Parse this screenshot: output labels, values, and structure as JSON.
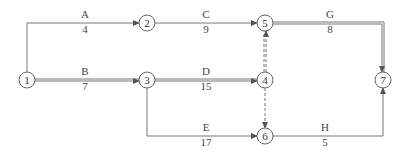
{
  "diagram": {
    "type": "activity-on-arrow network",
    "nodes": [
      {
        "id": "1",
        "label": "1"
      },
      {
        "id": "2",
        "label": "2"
      },
      {
        "id": "3",
        "label": "3"
      },
      {
        "id": "4",
        "label": "4"
      },
      {
        "id": "5",
        "label": "5"
      },
      {
        "id": "6",
        "label": "6"
      },
      {
        "id": "7",
        "label": "7"
      }
    ],
    "activities": [
      {
        "name": "A",
        "duration": "4",
        "from": "1",
        "to": "2",
        "critical": false
      },
      {
        "name": "B",
        "duration": "7",
        "from": "1",
        "to": "3",
        "critical": true
      },
      {
        "name": "C",
        "duration": "9",
        "from": "2",
        "to": "5",
        "critical": false
      },
      {
        "name": "D",
        "duration": "15",
        "from": "3",
        "to": "4",
        "critical": true
      },
      {
        "name": "E",
        "duration": "17",
        "from": "3",
        "to": "6",
        "critical": false
      },
      {
        "name": "G",
        "duration": "8",
        "from": "5",
        "to": "7",
        "critical": true
      },
      {
        "name": "H",
        "duration": "5",
        "from": "6",
        "to": "7",
        "critical": false
      }
    ],
    "dummies": [
      {
        "from": "4",
        "to": "5",
        "critical": true
      },
      {
        "from": "4",
        "to": "6",
        "critical": false
      }
    ]
  }
}
